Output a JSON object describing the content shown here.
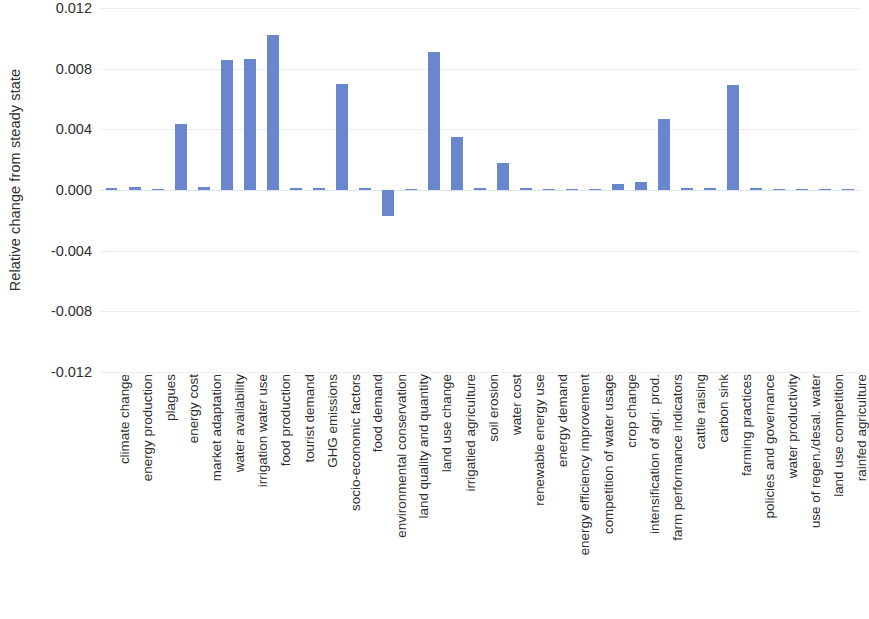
{
  "chart_data": {
    "type": "bar",
    "title": "",
    "subtitle": "",
    "xlabel": "",
    "ylabel": "Relative change from steady state",
    "ylim": [
      -0.012,
      0.012
    ],
    "yticks": [
      0.012,
      0.008,
      0.004,
      0.0,
      -0.004,
      -0.008,
      -0.012
    ],
    "ytick_labels": [
      "0.012",
      "0.008",
      "0.004",
      "0.000",
      "-0.004",
      "-0.008",
      "-0.012"
    ],
    "grid": true,
    "grid_axis": "y",
    "legend": false,
    "legend_position": "none",
    "bar_color": "#6a87ce",
    "gridline_color": "#e9eef6",
    "categories": [
      "climate change",
      "energy production",
      "plagues",
      "energy cost",
      "market adaptation",
      "water availability",
      "irrigation water use",
      "food production",
      "tourist demand",
      "GHG emissions",
      "socio-economic factors",
      "food demand",
      "environmental conservation",
      "land quality and quantity",
      "land use change",
      "irrigatied agriculture",
      "soil erosion",
      "water cost",
      "renewable energy use",
      "energy demand",
      "energy efficiency improvement",
      "competition of water usage",
      "crop change",
      "intensification of agri. prod.",
      "farm performance indicators",
      "cattle raising",
      "carbon sink",
      "farming practices",
      "policies and governance",
      "water productivity",
      "use of regen./desal. water",
      "land use competition",
      "rainfed agriculture"
    ],
    "values": [
      0.00012,
      0.00022,
      7e-05,
      0.00435,
      0.00018,
      0.00855,
      0.00862,
      0.0102,
      0.0001,
      0.00012,
      0.007,
      0.0001,
      -0.0017,
      8e-05,
      0.0091,
      0.0035,
      0.0001,
      0.00175,
      0.0001,
      8e-05,
      8e-05,
      8e-05,
      0.0004,
      0.00055,
      0.00465,
      0.0001,
      0.0001,
      0.0069,
      0.0001,
      8e-05,
      8e-05,
      8e-05,
      8e-05
    ]
  }
}
